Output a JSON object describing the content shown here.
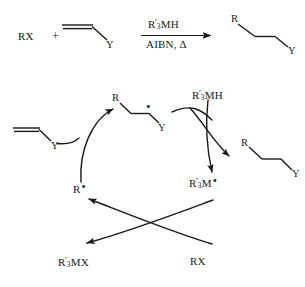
{
  "figure": {
    "type": "reaction-scheme"
  },
  "overall_reaction": {
    "reactant_1": "RX",
    "plus": "+",
    "reactant_2_label": "Y",
    "reagent_above_arrow": {
      "r": "R",
      "prime": "′",
      "sub": "3",
      "rest": "MH"
    },
    "conditions_below_arrow": "AIBN, Δ",
    "product": {
      "left_label": "R",
      "right_label": "Y"
    }
  },
  "cycle": {
    "alkene_in": {
      "label": "Y"
    },
    "adduct_radical": {
      "left_label": "R",
      "right_label": "Y",
      "radical_dot": "•"
    },
    "carbon_radical": {
      "r": "R",
      "dot": "•"
    },
    "metal_hydride": {
      "r": "R",
      "prime": "′",
      "sub": "3",
      "rest": "MH"
    },
    "metal_radical": {
      "r": "R",
      "prime": "′",
      "sub": "3",
      "rest": "M",
      "dot": "•"
    },
    "product": {
      "left_label": "R",
      "right_label": "Y"
    },
    "metal_halide": {
      "r": "R",
      "prime": "′",
      "sub": "3",
      "rest": "MX"
    },
    "halide_in": "RX"
  },
  "colors": {
    "ink": "#1a1a1a",
    "background": "#ffffff"
  }
}
